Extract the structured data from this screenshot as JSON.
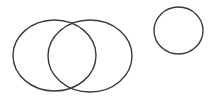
{
  "diagram": {
    "background": "#ffffff",
    "stroke_color": "#3a3a3a",
    "stroke_width": 1.4,
    "shapes": [
      {
        "id": "ellipse-left",
        "type": "ellipse",
        "cx": 54.5,
        "cy": 55.5,
        "rx": 41.5,
        "ry": 35.5
      },
      {
        "id": "ellipse-right",
        "type": "ellipse",
        "cx": 90,
        "cy": 56,
        "rx": 42,
        "ry": 36
      },
      {
        "id": "circle-standalone",
        "type": "ellipse",
        "cx": 178.5,
        "cy": 30.5,
        "rx": 24.5,
        "ry": 23.5
      }
    ]
  }
}
